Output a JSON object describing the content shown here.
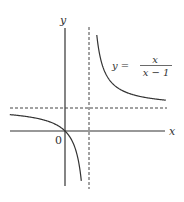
{
  "chart_data": {
    "type": "line",
    "title": "",
    "xlabel": "x",
    "ylabel": "y",
    "origin_label": "0",
    "equation": {
      "lhs": "y =",
      "numerator": "x",
      "denominator": "x − 1"
    },
    "function": "y = x/(x-1)",
    "asymptotes": {
      "vertical": 1,
      "horizontal": 1,
      "style": "dashed"
    },
    "series": [
      {
        "name": "left branch",
        "x": [
          -2.3,
          -2,
          -1.5,
          -1,
          -0.5,
          0,
          0.3,
          0.5,
          0.65
        ],
        "y": [
          0.7,
          0.667,
          0.6,
          0.5,
          0.333,
          0,
          -0.429,
          -1,
          -1.857
        ]
      },
      {
        "name": "right branch",
        "x": [
          1.33,
          1.5,
          2,
          2.5,
          3,
          3.5,
          4.2
        ],
        "y": [
          4.0,
          3.0,
          2.0,
          1.667,
          1.5,
          1.4,
          1.31
        ]
      }
    ],
    "grid": false,
    "legend": "none",
    "colors": {
      "curve": "#333333",
      "axes": "#333333",
      "asymptote": "#444444"
    }
  }
}
